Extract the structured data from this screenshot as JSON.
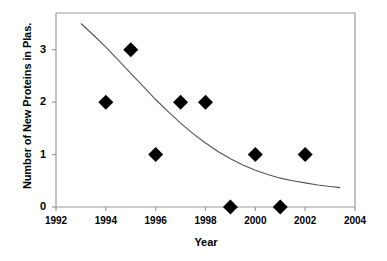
{
  "chart_data": {
    "type": "scatter",
    "title": "",
    "xlabel": "Year",
    "ylabel": "Number of New Proteins in Plas.",
    "xlim": [
      1992,
      2004
    ],
    "ylim": [
      0,
      3.7
    ],
    "grid": false,
    "legend": null,
    "xticks": [
      "1992",
      "1994",
      "1996",
      "1998",
      "2000",
      "2002",
      "2004"
    ],
    "xtick_values": [
      1992,
      1994,
      1996,
      1998,
      2000,
      2002,
      2004
    ],
    "yticks": [
      "0",
      "1",
      "2",
      "3"
    ],
    "ytick_values": [
      0,
      1,
      2,
      3
    ],
    "marker": "filled-diamond",
    "marker_color": "#000000",
    "series": [
      {
        "name": "New proteins per year",
        "x": [
          1994,
          1995,
          1996,
          1997,
          1998,
          1999,
          2000,
          2001,
          2002
        ],
        "values": [
          2,
          3,
          1,
          2,
          2,
          0,
          1,
          0,
          1
        ]
      }
    ],
    "trendline": {
      "name": "exponential decay fit",
      "color": "#555555",
      "x": [
        1993,
        1993.5,
        1994,
        1994.5,
        1995,
        1995.5,
        1996,
        1996.5,
        1997,
        1997.5,
        1998,
        1998.5,
        1999,
        1999.5,
        2000,
        2000.5,
        2001,
        2001.5,
        2002,
        2002.5,
        2003,
        2003.4
      ],
      "values": [
        3.5,
        3.28,
        3.05,
        2.8,
        2.55,
        2.3,
        2.05,
        1.82,
        1.6,
        1.4,
        1.22,
        1.06,
        0.92,
        0.8,
        0.7,
        0.62,
        0.55,
        0.5,
        0.46,
        0.42,
        0.39,
        0.37
      ]
    }
  },
  "axes": {
    "y_title": "Number of New Proteins in Plas.",
    "x_title": "Year"
  }
}
